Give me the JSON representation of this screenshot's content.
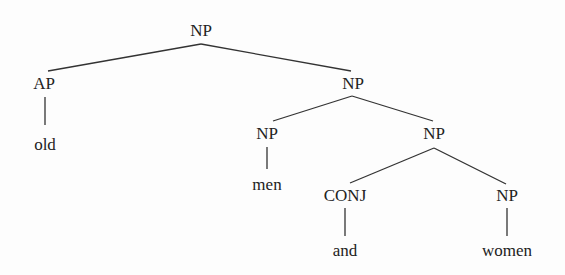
{
  "diagram": {
    "type": "syntax-tree",
    "line_color": "#333333",
    "nodes": [
      {
        "id": "n0",
        "label": "NP",
        "x": 201,
        "y": 30
      },
      {
        "id": "n1",
        "label": "AP",
        "x": 44,
        "y": 83
      },
      {
        "id": "n2",
        "label": "NP",
        "x": 353,
        "y": 83
      },
      {
        "id": "n3",
        "label": "old",
        "x": 45,
        "y": 144
      },
      {
        "id": "n4",
        "label": "NP",
        "x": 267,
        "y": 133
      },
      {
        "id": "n5",
        "label": "NP",
        "x": 434,
        "y": 133
      },
      {
        "id": "n6",
        "label": "men",
        "x": 267,
        "y": 184
      },
      {
        "id": "n7",
        "label": "CONJ",
        "x": 345,
        "y": 195
      },
      {
        "id": "n8",
        "label": "NP",
        "x": 507,
        "y": 195
      },
      {
        "id": "n9",
        "label": "and",
        "x": 345,
        "y": 250
      },
      {
        "id": "n10",
        "label": "women",
        "x": 507,
        "y": 250
      }
    ],
    "edges": [
      {
        "from": "n0",
        "to": "n1",
        "x1": 201,
        "y1": 44,
        "x2": 48,
        "y2": 71
      },
      {
        "from": "n0",
        "to": "n2",
        "x1": 201,
        "y1": 44,
        "x2": 351,
        "y2": 71
      },
      {
        "from": "n1",
        "to": "n3",
        "x1": 45,
        "y1": 97,
        "x2": 45,
        "y2": 125
      },
      {
        "from": "n2",
        "to": "n4",
        "x1": 352,
        "y1": 96,
        "x2": 273,
        "y2": 121
      },
      {
        "from": "n2",
        "to": "n5",
        "x1": 352,
        "y1": 96,
        "x2": 433,
        "y2": 121
      },
      {
        "from": "n4",
        "to": "n6",
        "x1": 267,
        "y1": 147,
        "x2": 267,
        "y2": 169
      },
      {
        "from": "n5",
        "to": "n7",
        "x1": 434,
        "y1": 148,
        "x2": 350,
        "y2": 183
      },
      {
        "from": "n5",
        "to": "n8",
        "x1": 434,
        "y1": 148,
        "x2": 506,
        "y2": 184
      },
      {
        "from": "n7",
        "to": "n9",
        "x1": 345,
        "y1": 208,
        "x2": 345,
        "y2": 236
      },
      {
        "from": "n8",
        "to": "n10",
        "x1": 507,
        "y1": 208,
        "x2": 507,
        "y2": 236
      }
    ]
  }
}
